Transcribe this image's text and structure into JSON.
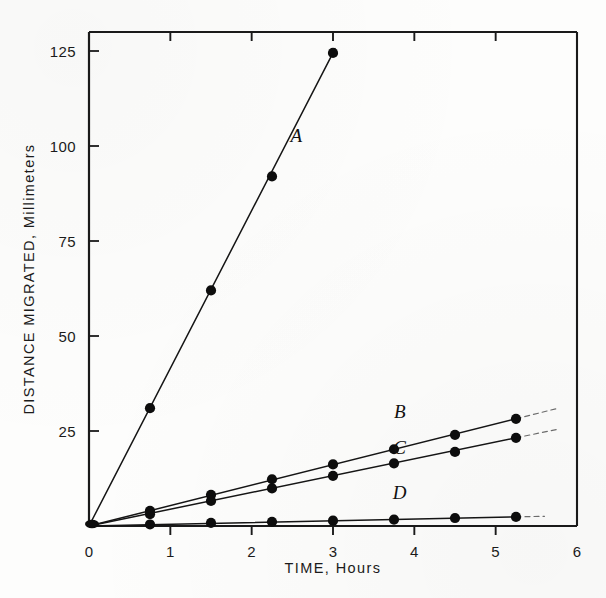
{
  "figure": {
    "caption_present": false,
    "ink_color": "#111111",
    "background_color": "#fdfdfc"
  },
  "chart_data": {
    "type": "line",
    "title": "",
    "subtitle": "",
    "xlabel": "TIME, Hours",
    "ylabel": "DISTANCE MIGRATED, Millimeters",
    "xlim": [
      0,
      6
    ],
    "ylim": [
      0,
      130
    ],
    "xticks": [
      0,
      1,
      2,
      3,
      4,
      5,
      6
    ],
    "xticklabels": [
      "0",
      "1",
      "2",
      "3",
      "4",
      "5",
      "6"
    ],
    "yticks": [
      25,
      50,
      75,
      100,
      125
    ],
    "yticklabels": [
      "25",
      "50",
      "75",
      "100",
      "125"
    ],
    "grid": false,
    "legend": "inline-labels",
    "marker": "filled-circle",
    "series": [
      {
        "name": "A",
        "label": "A",
        "label_x": 2.55,
        "label_y": 101,
        "slope_mm_per_hour": 41.2,
        "x": [
          0,
          0.75,
          1.5,
          2.25,
          3.0
        ],
        "y": [
          0,
          31,
          62,
          92,
          124.5
        ],
        "dash_extend_to_x": 3.05
      },
      {
        "name": "B",
        "label": "B",
        "label_x": 3.82,
        "label_y": 28.5,
        "slope_mm_per_hour": 5.4,
        "x": [
          0,
          0.75,
          1.5,
          2.25,
          3.0,
          3.75,
          4.5,
          5.25
        ],
        "y": [
          0,
          4.0,
          8.2,
          12.3,
          16.2,
          20.2,
          24.0,
          28.2
        ],
        "dash_extend_to_x": 5.75
      },
      {
        "name": "C",
        "label": "C",
        "label_x": 3.82,
        "label_y": 19.0,
        "slope_mm_per_hour": 4.4,
        "x": [
          0,
          0.75,
          1.5,
          2.25,
          3.0,
          3.75,
          4.5,
          5.25
        ],
        "y": [
          0,
          3.1,
          6.6,
          9.9,
          13.2,
          16.5,
          19.5,
          23.2
        ],
        "dash_extend_to_x": 5.75
      },
      {
        "name": "D",
        "label": "D",
        "label_x": 3.82,
        "label_y": 7.2,
        "slope_mm_per_hour": 0.45,
        "x": [
          0,
          0.75,
          1.5,
          2.25,
          3.0,
          3.75,
          4.5,
          5.25
        ],
        "y": [
          0,
          0.4,
          0.8,
          1.1,
          1.4,
          1.7,
          2.1,
          2.4
        ],
        "dash_extend_to_x": 5.6
      }
    ]
  }
}
